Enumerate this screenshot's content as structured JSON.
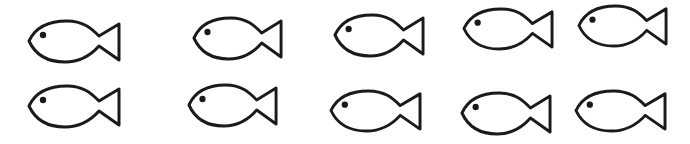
{
  "scene": {
    "description": "Two rows of five fish outline drawings",
    "background": "#ffffff",
    "stroke_color": "#1a1a1a",
    "fish_count": 10,
    "rows": 2,
    "per_row": 5
  },
  "fish": [
    {
      "row": 1,
      "col": 1,
      "x": 27,
      "y": 18,
      "w": 94,
      "h": 46
    },
    {
      "row": 1,
      "col": 2,
      "x": 192,
      "y": 15,
      "w": 91,
      "h": 46
    },
    {
      "row": 1,
      "col": 3,
      "x": 333,
      "y": 12,
      "w": 92,
      "h": 46
    },
    {
      "row": 1,
      "col": 4,
      "x": 462,
      "y": 6,
      "w": 92,
      "h": 45
    },
    {
      "row": 1,
      "col": 5,
      "x": 577,
      "y": 3,
      "w": 91,
      "h": 45
    },
    {
      "row": 2,
      "col": 1,
      "x": 27,
      "y": 83,
      "w": 94,
      "h": 46
    },
    {
      "row": 2,
      "col": 2,
      "x": 187,
      "y": 82,
      "w": 91,
      "h": 46
    },
    {
      "row": 2,
      "col": 3,
      "x": 329,
      "y": 88,
      "w": 93,
      "h": 45
    },
    {
      "row": 2,
      "col": 4,
      "x": 460,
      "y": 90,
      "w": 92,
      "h": 46
    },
    {
      "row": 2,
      "col": 5,
      "x": 574,
      "y": 88,
      "w": 93,
      "h": 45
    }
  ]
}
